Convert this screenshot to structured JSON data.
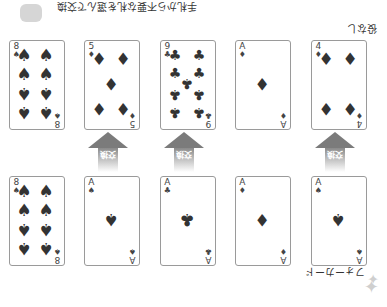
{
  "orientation": "rotated-180",
  "instruction_text": "手札から不要な札を選んで交換",
  "labels": {
    "before_hand": "役なし",
    "after_hand": "フォーカード",
    "exchange": "交換"
  },
  "before_row": [
    {
      "rank": "8",
      "suit": "♠"
    },
    {
      "rank": "5",
      "suit": "♦"
    },
    {
      "rank": "9",
      "suit": "♣"
    },
    {
      "rank": "A",
      "suit": "♦"
    },
    {
      "rank": "4",
      "suit": "♦"
    }
  ],
  "after_row": [
    {
      "rank": "8",
      "suit": "♠"
    },
    {
      "rank": "A",
      "suit": "♠"
    },
    {
      "rank": "A",
      "suit": "♣"
    },
    {
      "rank": "A",
      "suit": "♦"
    },
    {
      "rank": "A",
      "suit": "♠"
    }
  ],
  "exchanged_positions": [
    2,
    3,
    5
  ]
}
